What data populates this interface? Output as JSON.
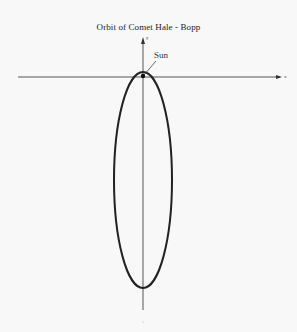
{
  "diagram": {
    "title": "Orbit of Comet Hale - Bopp",
    "axes": {
      "x_label": "x",
      "y_label": "y"
    },
    "labels": {
      "sun": "Sun"
    },
    "orbit": {
      "shape": "ellipse",
      "center": [
        143,
        180
      ],
      "semi_axis_x": 29,
      "semi_axis_y": 108,
      "focus_object": "Sun"
    },
    "colors": {
      "background": "#f8f8f8",
      "orbit_stroke": "#222222",
      "axis_stroke": "#555555",
      "text": "#222222"
    }
  }
}
